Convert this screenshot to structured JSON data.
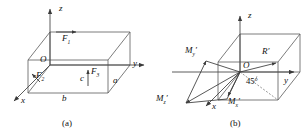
{
  "figure": {
    "panels": [
      {
        "caption": "(a)",
        "axes": [
          {
            "name": "z-axis",
            "label": "z"
          },
          {
            "name": "y-axis",
            "label": "y"
          },
          {
            "name": "x-axis",
            "label": "x"
          }
        ],
        "origin_label": "O",
        "forces": [
          {
            "name": "force-f1",
            "label": "F",
            "sub": "1"
          },
          {
            "name": "force-f2",
            "label": "F",
            "sub": "2"
          },
          {
            "name": "force-f3",
            "label": "F",
            "sub": "3"
          }
        ],
        "dimensions": [
          {
            "name": "dim-a",
            "label": "a"
          },
          {
            "name": "dim-b",
            "label": "b"
          },
          {
            "name": "dim-c",
            "label": "c"
          }
        ]
      },
      {
        "caption": "(b)",
        "axes": [
          {
            "name": "z-axis",
            "label": "z"
          },
          {
            "name": "y-axis",
            "label": "y"
          },
          {
            "name": "x-axis",
            "label": "x"
          }
        ],
        "origin_label": "O",
        "resultant": {
          "label": "R",
          "prime": "′"
        },
        "moments": [
          {
            "name": "moment-my",
            "label": "M",
            "sub": "y",
            "prime": "′"
          },
          {
            "name": "moment-mz",
            "label": "M",
            "sub": "z",
            "prime": "′"
          },
          {
            "name": "moment-mx",
            "label": "M",
            "sub": "x",
            "prime": "′"
          }
        ],
        "angle": "45°"
      }
    ]
  },
  "style": {
    "line_color": "#3a3a3a",
    "text_color": "#111111"
  }
}
